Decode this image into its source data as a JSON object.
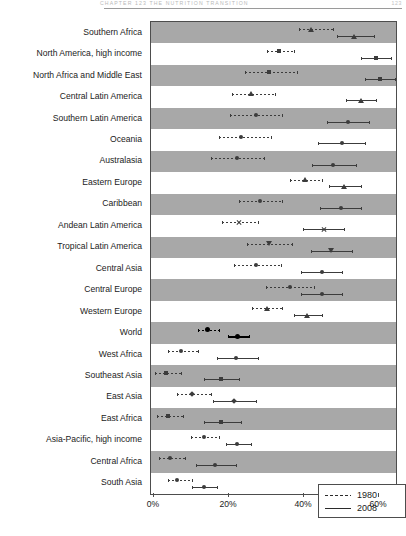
{
  "header": {
    "running_head": "CHAPTER 123      THE NUTRITION TRANSITION",
    "page_number": "123"
  },
  "chart_data": {
    "type": "scatter",
    "title": "",
    "subtitle": "",
    "xlabel": "",
    "ylabel": "",
    "xlim": [
      -2,
      70
    ],
    "grid": false,
    "legend_position": "bottom-right",
    "xticks": [
      0,
      20,
      40,
      60
    ],
    "xtick_labels": [
      "0%",
      "20%",
      "40%",
      "60%"
    ],
    "legend": [
      {
        "name": "1980",
        "style": "dashed"
      },
      {
        "name": "2008",
        "style": "solid"
      }
    ],
    "categories": [
      "Southern Africa",
      "North America, high income",
      "North Africa and Middle East",
      "Central Latin America",
      "Southern Latin America",
      "Oceania",
      "Australasia",
      "Eastern Europe",
      "Caribbean",
      "Andean Latin America",
      "Tropical Latin America",
      "Central Asia",
      "Central Europe",
      "Western Europe",
      "World",
      "West Africa",
      "Southeast Asia",
      "East Asia",
      "East Africa",
      "Asia-Pacific, high income",
      "Central Africa",
      "South Asia"
    ],
    "series": [
      {
        "name": "1980",
        "style": "dashed",
        "marker": [
          "triangle",
          "square",
          "square",
          "triangle",
          "circle",
          "circle",
          "circle",
          "triangle",
          "circle",
          "x",
          "tridown",
          "circle",
          "circle",
          "triangle",
          "circle",
          "circle",
          "square",
          "diamond",
          "square",
          "circle",
          "circle",
          "circle"
        ],
        "values": [
          42.0,
          33.5,
          31.0,
          26.0,
          27.5,
          23.5,
          22.5,
          40.5,
          28.5,
          23.0,
          31.0,
          27.5,
          36.5,
          30.5,
          14.5,
          7.5,
          3.5,
          10.5,
          4.0,
          13.5,
          4.5,
          6.5
        ],
        "ci_low": [
          39.0,
          30.5,
          24.5,
          21.0,
          20.5,
          17.5,
          15.5,
          36.5,
          23.0,
          18.5,
          25.0,
          21.5,
          30.0,
          26.5,
          12.0,
          4.0,
          0.5,
          6.5,
          1.0,
          10.0,
          1.5,
          4.0
        ],
        "ci_high": [
          48.0,
          37.5,
          38.5,
          32.5,
          34.5,
          31.5,
          29.5,
          45.0,
          34.5,
          28.0,
          37.0,
          34.0,
          43.0,
          34.5,
          17.5,
          12.0,
          7.5,
          15.5,
          8.0,
          17.5,
          8.5,
          10.5
        ]
      },
      {
        "name": "2008",
        "style": "solid",
        "marker": [
          "triangle",
          "square",
          "square",
          "triangle",
          "circle",
          "circle",
          "circle",
          "triangle",
          "circle",
          "x",
          "tridown",
          "circle",
          "circle",
          "triangle",
          "circle",
          "circle",
          "square",
          "diamond",
          "square",
          "circle",
          "circle",
          "circle"
        ],
        "values": [
          53.5,
          59.5,
          60.5,
          55.5,
          52.0,
          50.5,
          48.0,
          51.0,
          50.0,
          45.5,
          47.5,
          45.0,
          45.0,
          41.0,
          22.5,
          22.0,
          18.0,
          21.5,
          18.0,
          22.5,
          16.5,
          13.5
        ],
        "ci_low": [
          49.0,
          55.5,
          56.5,
          51.5,
          46.5,
          44.0,
          42.5,
          47.0,
          44.5,
          40.0,
          42.0,
          39.5,
          39.5,
          37.5,
          20.0,
          17.0,
          13.5,
          16.0,
          13.5,
          19.5,
          11.5,
          10.5
        ],
        "ci_high": [
          59.0,
          63.5,
          64.5,
          59.5,
          57.5,
          56.5,
          54.0,
          55.5,
          55.5,
          51.0,
          53.0,
          50.5,
          50.5,
          45.0,
          25.5,
          28.0,
          23.0,
          27.5,
          23.5,
          26.0,
          22.0,
          17.0
        ]
      }
    ]
  }
}
